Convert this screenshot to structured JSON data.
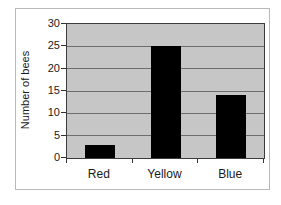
{
  "chart_data": {
    "type": "bar",
    "title": "",
    "xlabel": "",
    "ylabel": "Number of bees",
    "categories": [
      "Red",
      "Yellow",
      "Blue"
    ],
    "values": [
      3,
      25,
      14
    ],
    "ylim": [
      0,
      30
    ],
    "yticks": [
      0,
      5,
      10,
      15,
      20,
      25,
      30
    ],
    "grid": true,
    "legend_position": "none",
    "colors": {
      "bar": "#000000",
      "plot_background": "#c6c6c6",
      "gridline": "#6e6e6e",
      "axis_line": "#3c3c3c",
      "frame_border": "#b9b9b9",
      "page_background": "#ffffff",
      "text": "#1a1a1a"
    }
  }
}
